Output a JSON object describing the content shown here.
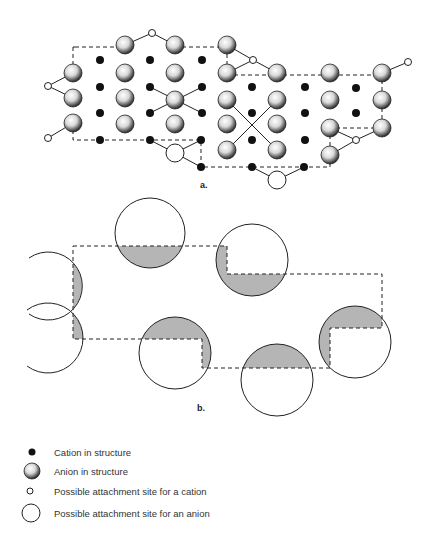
{
  "figure": {
    "panel_a": {
      "label": "a.",
      "description": "Crystal lattice cross-section showing cations, anions, and possible attachment sites along a stepped surface"
    },
    "panel_b": {
      "label": "b.",
      "description": "Schematic of anion-sized attachment sites overlapping the stepped crystal outline (shaded = overlap)"
    },
    "legend": [
      {
        "symbol": "cation-dot",
        "label": "Cation in structure"
      },
      {
        "symbol": "anion-sphere",
        "label": "Anion in structure"
      },
      {
        "symbol": "small-open-circle",
        "label": "Possible attachment site for a cation"
      },
      {
        "symbol": "large-open-circle",
        "label": "Possible attachment site for an anion"
      }
    ],
    "colors": {
      "line": "#222222",
      "shade": "#b5b5b5",
      "background": "#ffffff"
    }
  }
}
